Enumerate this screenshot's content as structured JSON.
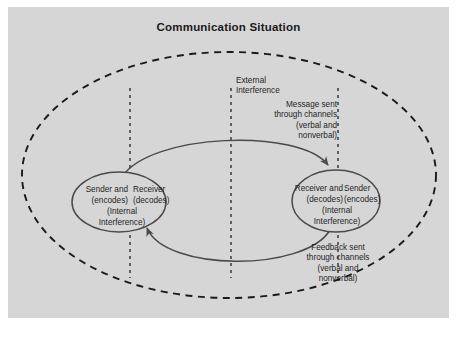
{
  "title": "Communication Situation",
  "colors": {
    "panel_background": "#d6d6d6",
    "page_background": "#ffffff",
    "stroke": "#4a4a4a",
    "dashed_stroke": "#1a1a1a",
    "text": "#1f1f1f",
    "node_fill": "#d6d6d6"
  },
  "annotations": {
    "external_interference": "External\nInterference",
    "message_sent": "Message sent\nthrough channels\n(verbal and\nnonverbal)",
    "feedback_sent": "Feedback sent\nthrough channels\n(verbal and\nnonverbal)"
  },
  "nodes": {
    "left": {
      "role_a": "Sender   and",
      "role_b": "Receiver",
      "role_a_sub": "(encodes)",
      "role_b_sub": "(decodes)",
      "internal": "(Internal\nInterference)"
    },
    "right": {
      "role_a": "Receiver   and",
      "role_b": "Sender",
      "role_a_sub": "(decodes)",
      "role_b_sub": "(encodes)",
      "internal": "(Internal\nInterference)"
    }
  },
  "icons": {
    "message_arrow": "curved-arrow-right-icon",
    "feedback_arrow": "curved-arrow-left-icon",
    "outer_boundary": "dashed-ellipse-icon",
    "interference_line": "vertical-dashed-line-icon"
  }
}
